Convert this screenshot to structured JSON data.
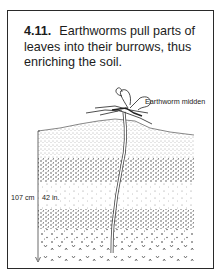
{
  "figure": {
    "number": "4.11.",
    "caption": "Earthworms pull parts of leaves into their burrows, thus enriching the soil.",
    "labels": {
      "midden": "Earthworm midden",
      "depth_cm": "107 cm",
      "depth_in": "42 in."
    }
  }
}
